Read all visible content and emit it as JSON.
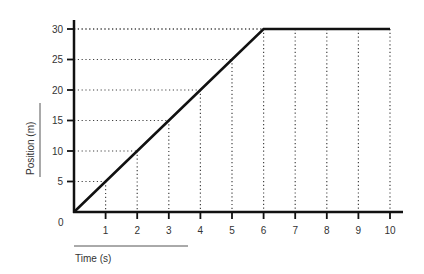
{
  "chart_data": {
    "type": "line",
    "title": "",
    "xlabel": "Time (s)",
    "ylabel": "Position (m)",
    "x_ticks": [
      1,
      2,
      3,
      4,
      5,
      6,
      7,
      8,
      9,
      10
    ],
    "y_ticks": [
      5,
      10,
      15,
      20,
      25,
      30
    ],
    "origin_label": "0",
    "xlim": [
      0,
      10.4
    ],
    "ylim": [
      0,
      31.5
    ],
    "grid": "dotted guide lines from axes to data points",
    "series": [
      {
        "name": "Position",
        "x": [
          0,
          1,
          2,
          3,
          4,
          5,
          6,
          7,
          8,
          9,
          10
        ],
        "y": [
          0,
          5,
          10,
          15,
          20,
          25,
          30,
          30,
          30,
          30,
          30
        ]
      }
    ],
    "legend": null
  },
  "colors": {
    "line": "#111111",
    "grid": "#444444",
    "text": "#333333"
  }
}
